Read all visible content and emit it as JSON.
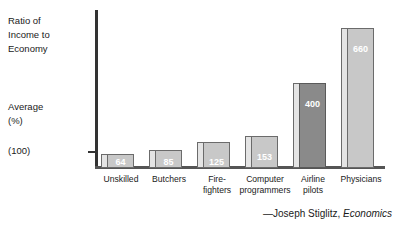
{
  "chart_data": {
    "type": "bar",
    "title": "",
    "ylabel": "Ratio of Income to Economy",
    "xlabel": "",
    "categories": [
      "Unskilled",
      "Butchers",
      "Fire-fighters",
      "Computer programmers",
      "Airline pilots",
      "Physicians"
    ],
    "values": [
      64,
      85,
      125,
      153,
      400,
      660
    ],
    "ylim": [
      0,
      700
    ],
    "grid": false,
    "legend": false,
    "reference_line_label": "Average (%)",
    "baseline_tick_label": "(100)",
    "highlight_category": "Airline pilots",
    "annotations": [
      "—Joseph Stiglitz, Economics"
    ]
  },
  "axis": {
    "title_line1": "Ratio of",
    "title_line2": "Income to",
    "title_line3": "Economy",
    "average_line1": "Average",
    "average_line2": "(%)",
    "baseline": "(100)"
  },
  "bars": [
    {
      "category_line1": "Unskilled",
      "category_line2": "",
      "value": "64"
    },
    {
      "category_line1": "Butchers",
      "category_line2": "",
      "value": "85"
    },
    {
      "category_line1": "Fire-",
      "category_line2": "fighters",
      "value": "125"
    },
    {
      "category_line1": "Computer",
      "category_line2": "programmers",
      "value": "153"
    },
    {
      "category_line1": "Airline",
      "category_line2": "pilots",
      "value": "400"
    },
    {
      "category_line1": "Physicians",
      "category_line2": "",
      "value": "660"
    }
  ],
  "attribution": {
    "author": "—Joseph Stiglitz,",
    "work": "Economics"
  },
  "colors": {
    "bar_fill": "#c8c8c8",
    "bar_fill_highlight": "#8a8a8a",
    "bar_side": "#e4e4e4",
    "bar_outline": "#6b6b6b",
    "axis": "#333333",
    "text": "#1a1a1a"
  }
}
